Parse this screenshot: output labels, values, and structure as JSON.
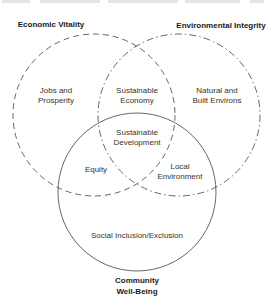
{
  "diagram": {
    "type": "venn",
    "colors": {
      "background": "#ffffff",
      "stroke_dashed": "#555555",
      "stroke_solid": "#555555",
      "text": "#333333",
      "title_text": "#1a1a1a"
    },
    "circles": [
      {
        "id": "economic",
        "label": "Economic Vitality",
        "style": "dashed",
        "cx": 94,
        "cy": 115,
        "r": 81
      },
      {
        "id": "environmental",
        "label": "Environmental Integrity",
        "style": "dash-dot",
        "cx": 179,
        "cy": 115,
        "r": 81
      },
      {
        "id": "community",
        "label_line1": "Community",
        "label_line2": "Well-Being",
        "style": "solid",
        "cx": 137,
        "cy": 192,
        "r": 79
      }
    ],
    "regions": {
      "economic_only": {
        "line1": "Jobs and",
        "line2": "Prosperity"
      },
      "environmental_only": {
        "line1": "Natural and",
        "line2": "Built Environs"
      },
      "economic_environmental": {
        "line1": "Sustainable",
        "line2": "Economy"
      },
      "all_three": {
        "line1": "Sustainable",
        "line2": "Development"
      },
      "economic_community": {
        "line1": "Equity"
      },
      "environmental_community": {
        "line1": "Local",
        "line2": "Environment"
      },
      "community_only": {
        "line1": "Social Inclusion/Exclusion"
      }
    }
  }
}
